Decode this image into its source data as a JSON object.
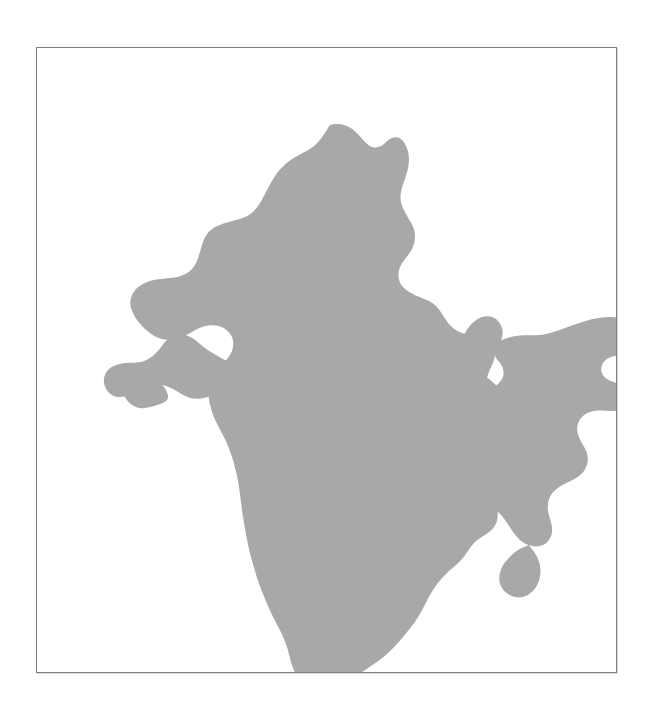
{
  "figure": {
    "title": "",
    "subject": "Map of India",
    "map_type": "country-silhouette",
    "region_name": "India",
    "caption": "",
    "labels": [],
    "legend": [],
    "annotations": [],
    "scalebar": "",
    "north_arrow": ""
  },
  "canvas": {
    "width_px": 650,
    "height_px": 709,
    "background_color": "#ffffff"
  },
  "frame": {
    "visible": true,
    "left_px": 36,
    "top_px": 47,
    "width_px": 581,
    "height_px": 626,
    "border_color": "#808080",
    "border_width_px": 1,
    "fill_color": "#ffffff"
  },
  "map": {
    "landmass_fill_color": "#a8a8a8",
    "landmass_stroke_color": "none",
    "sea_fill_color": "#ffffff",
    "viewbox": "0 0 581 626",
    "bounds_px": {
      "north_tip_x": 229,
      "north_tip_y": 25,
      "south_tip_x": 190,
      "south_tip_y": 580,
      "west_tip_x": 33,
      "west_tip_y": 253,
      "east_tip_x": 545,
      "east_tip_y": 213
    },
    "paths": {
      "mainland": "M 229 25 C 236 22 246 24 252 29 C 258 34 263 41 268 45 C 273 48 279 47 283 43 C 287 39 291 36 296 37 C 301 38 304 44 306 50 C 308 57 307 65 305 72 C 303 79 300 85 299 92 C 298 99 300 105 303 110 C 306 116 310 121 312 127 C 314 134 313 141 310 147 C 307 153 302 157 299 163 C 296 169 296 176 299 181 C 303 187 309 190 315 193 C 322 196 329 198 334 203 C 339 208 342 215 346 220 C 350 225 356 229 362 230 C 368 231 374 229 380 230 C 385 231 389 235 391 240 C 393 246 392 252 390 258 C 388 263 385 268 384 273 C 383 279 385 284 389 287 C 393 291 398 292 403 293 C 408 294 413 296 416 300 C 419 305 419 311 417 316 C 415 321 411 325 409 330 C 407 336 408 342 411 346 C 414 351 419 354 421 359 C 423 364 422 370 419 374 C 416 378 411 380 407 383 C 402 386 398 390 396 395 C 394 401 395 407 394 413 C 393 418 390 422 386 425 C 381 429 376 431 372 435 C 367 440 364 446 360 451 C 355 457 349 461 344 466 C 338 472 333 478 329 485 C 324 493 321 501 316 509 C 311 517 305 524 299 531 C 292 539 285 546 277 552 C 269 558 260 563 252 569 C 244 575 236 581 227 583 C 219 585 211 583 205 578 C 199 573 196 566 193 559 C 190 551 189 543 186 535 C 183 526 178 518 174 510 C 169 500 165 490 161 480 C 157 469 154 458 151 447 C 148 435 146 423 144 411 C 142 399 141 387 139 375 C 137 364 134 353 130 343 C 127 334 122 326 118 318 C 114 310 111 301 110 292 C 109 284 111 276 115 269 C 119 263 125 259 129 254 C 133 249 135 243 134 237 C 133 231 129 227 124 224 C 118 221 111 221 105 223 C 98 225 92 230 85 233 C 78 236 70 237 63 235 C 56 233 50 228 45 223 C 40 218 36 212 34 206 C 32 200 33 193 37 188 C 41 183 47 180 53 178 C 60 176 67 176 74 175 C 81 174 88 172 93 167 C 98 162 100 155 102 148 C 104 141 106 134 111 129 C 116 124 123 122 130 120 C 137 118 144 117 150 113 C 156 109 160 103 163 97 C 167 90 170 83 174 77 C 178 70 184 64 191 59 C 198 54 206 51 213 46 C 219 41 224 34 229 25 Z",
      "gujarat_kutch": "M 110 292 C 104 294 97 295 91 293 C 85 291 80 287 74 284 C 68 281 61 279 55 280 C 48 281 42 285 36 288 C 31 291 25 293 19 292 C 14 291 10 287 8 282 C 6 277 7 271 10 267 C 14 262 20 260 26 259 C 33 258 40 259 46 257 C 52 255 57 251 61 246 C 65 241 68 236 73 233 C 78 230 84 230 89 232 C 95 234 99 238 104 242 C 109 246 114 249 119 252 C 124 255 129 257 133 261 C 137 265 139 271 138 276 C 137 282 133 286 128 289 C 123 292 116 291 110 292 Z",
      "saurashtra_extra": "M 60 300 C 54 302 48 304 42 303 C 36 302 31 298 28 293 C 25 288 25 282 28 278 C 31 274 37 272 43 272 C 49 272 55 274 60 277 C 65 280 69 285 70 291 C 71 296 66 298 60 300 Z",
      "northeast_arunachal_assam": "M 391 240 C 398 236 406 233 414 232 C 422 231 430 232 438 231 C 446 230 454 227 462 224 C 470 221 478 218 486 216 C 494 214 503 213 511 214 C 518 215 525 218 530 222 C 534 226 536 232 535 238 C 534 243 530 247 525 249 C 520 251 514 251 509 252 C 504 253 499 256 497 261 C 495 266 497 271 501 274 C 505 277 511 278 516 280 C 521 282 526 285 528 290 C 530 295 528 300 524 303 C 519 306 513 306 507 306 C 501 306 495 305 489 306 C 483 307 478 310 475 315 C 472 320 472 326 474 331 C 476 337 480 341 482 347 C 484 353 483 359 480 364 C 476 370 470 373 464 376 C 458 379 452 382 448 387 C 444 392 443 399 444 405 C 445 411 448 417 448 423 C 448 429 445 434 441 437 C 436 440 430 440 425 438 C 419 436 415 432 411 427 C 407 422 404 416 400 411 C 396 406 391 402 387 397 C 383 392 380 386 379 380 C 378 374 380 368 383 363 C 386 358 391 355 394 350 C 397 345 398 339 396 334 C 394 329 390 326 386 322 C 382 318 378 314 376 309 C 374 304 374 298 377 293 C 380 288 385 286 390 283 C 395 280 399 276 400 271 C 401 265 398 260 394 256 C 391 251 389 246 391 240 Z",
      "sikkim_bulge": "M 362 230 C 365 224 369 219 374 216 C 379 213 385 212 390 214 C 395 216 398 221 399 226 C 400 232 398 238 394 242 C 390 246 384 247 379 245 C 373 243 368 239 364 236 C 361 234 360 232 362 230 Z",
      "mizoram_tripura_tail": "M 425 438 C 429 443 433 448 435 454 C 437 460 437 467 435 473 C 433 479 429 484 424 487 C 419 490 413 490 408 488 C 403 486 399 482 397 477 C 395 472 396 466 398 461 C 400 456 404 452 408 448 C 412 444 417 441 425 438 Z",
      "bengal_south_lobe": "M 384 273 C 389 277 394 281 397 286 C 400 291 401 297 400 303 C 399 309 396 314 392 318 C 388 322 382 324 377 323 C 371 322 367 318 364 313 C 361 308 360 302 361 296 C 362 290 365 285 369 281 C 373 277 378 274 384 273 Z"
    }
  }
}
